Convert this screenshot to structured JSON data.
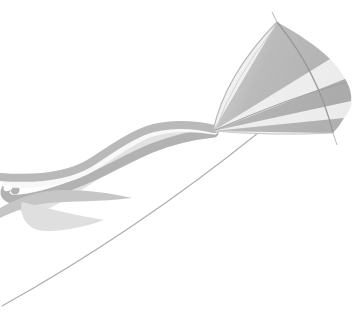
{
  "scene": {
    "type": "photograph",
    "alt_text": "A fan-shaped striped kite flying against a white background, trailing long wavy ribbon tails to the left and a thin kite string running toward the lower-left corner",
    "background_color": "#ffffff",
    "objects": {
      "kite_sail": "diamond kite sail with radial stripes converging at the nose, alternating gray and white panels",
      "kite_spars": "thin bowed spine from top tip to bottom tip and a cross spar from the nose to the right edge",
      "ribbon_tails": "several overlapping wavy ribbon streamers (gray, white and pale gray) flowing left from the kite nose, ending in curls, a small loop and pointed flicks",
      "kite_string": "thin slightly sagging line from below the kite to the lower-left edge of the frame"
    },
    "palette": {
      "background": "#ffffff",
      "sail_dark_panel": "#b0b0b0",
      "sail_light_panel": "#ececec",
      "spar_line": "#989898",
      "ribbon_dark": "#b6b6b6",
      "ribbon_light": "#e2e2e2",
      "ribbon_white": "#f8f8f8",
      "string": "#aeaeae"
    },
    "counts": {
      "dark_sail_panels": 3,
      "light_sail_panels": 3,
      "visible_ribbon_tails": 5
    }
  }
}
